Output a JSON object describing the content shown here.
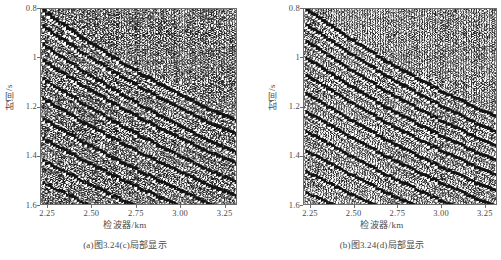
{
  "figure": {
    "type": "seismic-wiggle-trace-pair",
    "background_color": "#ffffff",
    "ink_color": "#1a1a1a",
    "axis_color": "#6e6e6e",
    "text_color": "#4a4a4a"
  },
  "panels": [
    {
      "id": "panel-a",
      "caption": "(a)图3.24(c)局部显示",
      "x_axis": {
        "title": "检波器/km",
        "ticks": [
          "2.25",
          "2.50",
          "2.75",
          "3.00",
          "3.25"
        ],
        "values": [
          2.25,
          2.5,
          2.75,
          3.0,
          3.25
        ],
        "min": 2.21,
        "max": 3.32
      },
      "y_axis": {
        "title": "时间/s",
        "ticks": [
          "0.8",
          "1",
          "1.2",
          "1.4",
          "1.6"
        ],
        "values": [
          0.8,
          1.0,
          1.2,
          1.4,
          1.6
        ],
        "min": 0.8,
        "max": 1.6,
        "direction": "increasing-downward"
      }
    },
    {
      "id": "panel-b",
      "caption": "(b)图3.24(d)局部显示",
      "x_axis": {
        "title": "检波器/km",
        "ticks": [
          "2.25",
          "2.50",
          "2.75",
          "3.00",
          "3.25"
        ],
        "values": [
          2.25,
          2.5,
          2.75,
          3.0,
          3.25
        ],
        "min": 2.21,
        "max": 3.32
      },
      "y_axis": {
        "title": "时间/s",
        "ticks": [
          "0.8",
          "1",
          "1.2",
          "1.4",
          "1.6"
        ],
        "values": [
          0.8,
          1.0,
          1.2,
          1.4,
          1.6
        ],
        "min": 0.8,
        "max": 1.6,
        "direction": "increasing-downward"
      }
    }
  ],
  "chart_data": [
    {
      "type": "line",
      "subtype": "seismic-wiggle-variable-area",
      "title": "(a)图3.24(c)局部显示",
      "xlabel": "检波器/km",
      "ylabel": "时间/s",
      "xlim": [
        2.21,
        3.32
      ],
      "ylim": [
        1.6,
        0.8
      ],
      "xticks": [
        2.25,
        2.5,
        2.75,
        3.0,
        3.25
      ],
      "yticks": [
        0.8,
        1.0,
        1.2,
        1.4,
        1.6
      ],
      "grid": false,
      "legend": null,
      "trace_count": 74,
      "trace_spacing_km": 0.015,
      "sample_rate_s": 0.002,
      "dominant_frequency_hz": 28,
      "noise_level": 0.3,
      "fill_polarity": "positive-black",
      "events": [
        {
          "name": "event-1",
          "t0_s": 0.805,
          "slope_s_per_km": 0.52,
          "amplitude": 0.95,
          "curvature": 0.1
        },
        {
          "name": "event-2",
          "t0_s": 0.87,
          "slope_s_per_km": 0.5,
          "amplitude": 0.88,
          "curvature": 0.09
        },
        {
          "name": "event-3",
          "t0_s": 0.945,
          "slope_s_per_km": 0.49,
          "amplitude": 0.82,
          "curvature": 0.08
        },
        {
          "name": "event-4",
          "t0_s": 1.01,
          "slope_s_per_km": 0.47,
          "amplitude": 0.9,
          "curvature": 0.08
        },
        {
          "name": "event-5",
          "t0_s": 1.085,
          "slope_s_per_km": 0.46,
          "amplitude": 0.78,
          "curvature": 0.07
        },
        {
          "name": "event-6",
          "t0_s": 1.165,
          "slope_s_per_km": 0.44,
          "amplitude": 0.85,
          "curvature": 0.07
        },
        {
          "name": "event-7",
          "t0_s": 1.25,
          "slope_s_per_km": 0.42,
          "amplitude": 0.8,
          "curvature": 0.06
        },
        {
          "name": "event-8",
          "t0_s": 1.33,
          "slope_s_per_km": 0.4,
          "amplitude": 0.74,
          "curvature": 0.06
        },
        {
          "name": "event-9",
          "t0_s": 1.42,
          "slope_s_per_km": 0.38,
          "amplitude": 0.7,
          "curvature": 0.05
        },
        {
          "name": "event-10",
          "t0_s": 1.51,
          "slope_s_per_km": 0.36,
          "amplitude": 0.66,
          "curvature": 0.05
        }
      ]
    },
    {
      "type": "line",
      "subtype": "seismic-wiggle-variable-area",
      "title": "(b)图3.24(d)局部显示",
      "xlabel": "检波器/km",
      "ylabel": "时间/s",
      "xlim": [
        2.21,
        3.32
      ],
      "ylim": [
        1.6,
        0.8
      ],
      "xticks": [
        2.25,
        2.5,
        2.75,
        3.0,
        3.25
      ],
      "yticks": [
        0.8,
        1.0,
        1.2,
        1.4,
        1.6
      ],
      "grid": false,
      "legend": null,
      "trace_count": 74,
      "trace_spacing_km": 0.015,
      "sample_rate_s": 0.002,
      "dominant_frequency_hz": 31,
      "noise_level": 0.22,
      "fill_polarity": "positive-black",
      "events": [
        {
          "name": "event-1",
          "t0_s": 0.8,
          "slope_s_per_km": 0.5,
          "amplitude": 1.0,
          "curvature": 0.09
        },
        {
          "name": "event-2",
          "t0_s": 0.862,
          "slope_s_per_km": 0.49,
          "amplitude": 0.94,
          "curvature": 0.08
        },
        {
          "name": "event-3",
          "t0_s": 0.93,
          "slope_s_per_km": 0.48,
          "amplitude": 0.92,
          "curvature": 0.08
        },
        {
          "name": "event-4",
          "t0_s": 1.0,
          "slope_s_per_km": 0.47,
          "amplitude": 0.96,
          "curvature": 0.08
        },
        {
          "name": "event-5",
          "t0_s": 1.07,
          "slope_s_per_km": 0.45,
          "amplitude": 0.9,
          "curvature": 0.07
        },
        {
          "name": "event-6",
          "t0_s": 1.145,
          "slope_s_per_km": 0.44,
          "amplitude": 0.93,
          "curvature": 0.07
        },
        {
          "name": "event-7",
          "t0_s": 1.22,
          "slope_s_per_km": 0.42,
          "amplitude": 0.89,
          "curvature": 0.06
        },
        {
          "name": "event-8",
          "t0_s": 1.3,
          "slope_s_per_km": 0.41,
          "amplitude": 0.86,
          "curvature": 0.06
        },
        {
          "name": "event-9",
          "t0_s": 1.38,
          "slope_s_per_km": 0.39,
          "amplitude": 0.84,
          "curvature": 0.05
        },
        {
          "name": "event-10",
          "t0_s": 1.465,
          "slope_s_per_km": 0.37,
          "amplitude": 0.8,
          "curvature": 0.05
        },
        {
          "name": "event-11",
          "t0_s": 1.55,
          "slope_s_per_km": 0.35,
          "amplitude": 0.76,
          "curvature": 0.05
        }
      ]
    }
  ]
}
